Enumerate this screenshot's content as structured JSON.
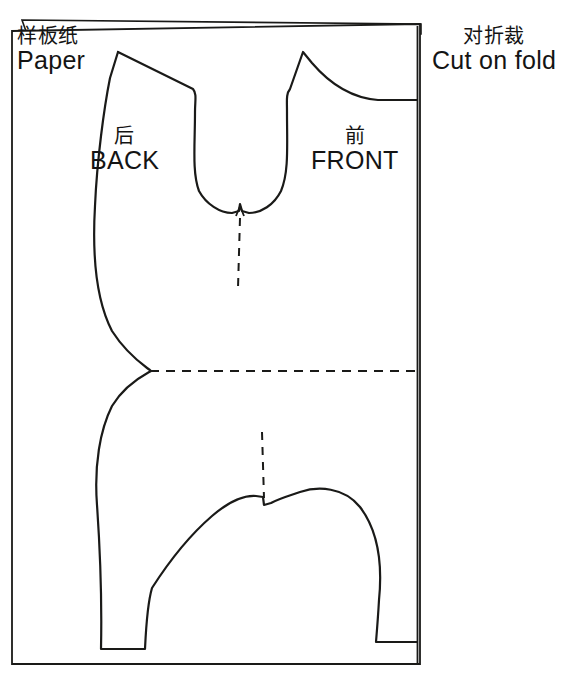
{
  "page": {
    "width": 567,
    "height": 676,
    "background_color": "#ffffff",
    "line_color": "#1a1a18"
  },
  "labels": {
    "paper": {
      "cn": "样板纸",
      "en": "Paper"
    },
    "cut_on_fold": {
      "cn": "对折裁",
      "en": "Cut on fold"
    },
    "back": {
      "cn": "后",
      "en": "BACK"
    },
    "front": {
      "cn": "前",
      "en": "FRONT"
    }
  },
  "diagram": {
    "type": "sewing-pattern",
    "paper_sheets": [
      {
        "name": "under-sheet",
        "points": "22,20 421,24 421,30 27,30"
      },
      {
        "name": "top-sheet",
        "points": "12,31 420,24 420,664 12,664"
      }
    ],
    "fold_line": {
      "name": "fold-line",
      "x": 418,
      "y1": 24,
      "y2": 664
    },
    "pattern_outline_path": "M 118,52 L 193,89 L 194,92 C 194,130 192,165 200,190 C 212,209 228,214 238,212 L 240,205 L 242,212 C 254,214 270,207 281,190 C 289,166 287,131 288,92 L 290,88 L 303,53 L 316,69 C 332,86 352,98 375,100 L 418,100 L 418,642 L 375,642 C 377,600 374,560 360,530 C 345,500 320,489 300,492 C 288,493 278,497 270,503 L 263,505 L 262,497 C 254,495 243,495 232,500 C 205,512 180,545 160,580 C 152,600 148,625 145,649 L 100,649 C 101,600 99,545 96,500 C 93,462 99,430 110,405 C 126,382 145,375 150,371 C 145,366 127,356 110,330 C 96,300 92,255 95,205 C 97,160 103,110 107,80 Z",
    "dashed_lines": [
      {
        "name": "center-front-neck-guide",
        "x1": 240,
        "y1": 216,
        "x2": 238,
        "y2": 288,
        "orientation": "vertical"
      },
      {
        "name": "waist-fold-guide",
        "x1": 150,
        "y1": 371,
        "x2": 418,
        "y2": 371,
        "orientation": "horizontal"
      },
      {
        "name": "center-crotch-guide",
        "x1": 263,
        "y1": 432,
        "x2": 265,
        "y2": 500,
        "orientation": "vertical"
      }
    ],
    "notches": [
      {
        "name": "neck-notch",
        "x": 240,
        "y": 212
      },
      {
        "name": "crotch-notch",
        "x": 263,
        "y": 502
      }
    ]
  }
}
